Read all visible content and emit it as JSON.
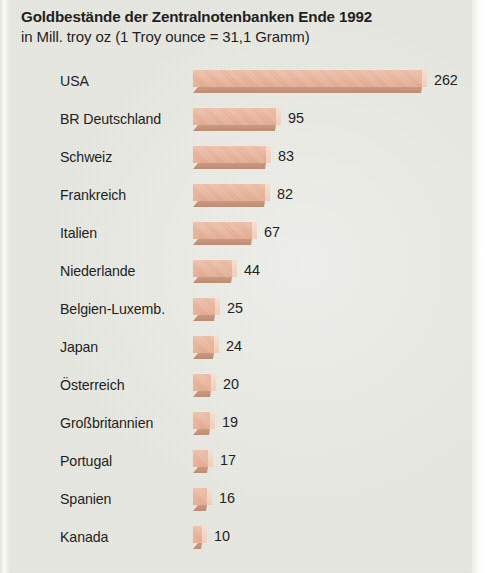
{
  "title": {
    "line1": "Goldbestände der Zentralnotenbanken Ende 1992",
    "line2": "in Mill. troy oz (1 Troy ounce = 31,1 Gramm)"
  },
  "colors": {
    "background": "#e9e9e3",
    "bar_face": "#e7b096",
    "bar_shadow": "#bd8b72",
    "bar_highlight": "#f4d8c7",
    "text": "#231f1c"
  },
  "chart_data": {
    "type": "bar",
    "orientation": "horizontal",
    "title": "Goldbestände der Zentralnotenbanken Ende 1992",
    "subtitle": "in Mill. troy oz (1 Troy ounce = 31,1 Gramm)",
    "xlabel": "",
    "ylabel": "",
    "unit": "Mill. troy oz",
    "grid": false,
    "legend": false,
    "xlim": [
      0,
      262
    ],
    "categories": [
      "USA",
      "BR Deutschland",
      "Schweiz",
      "Frankreich",
      "Italien",
      "Niederlande",
      "Belgien-Luxemb.",
      "Japan",
      "Österreich",
      "Großbritannien",
      "Portugal",
      "Spanien",
      "Kanada"
    ],
    "values": [
      262,
      95,
      83,
      82,
      67,
      44,
      25,
      24,
      20,
      19,
      17,
      16,
      10
    ],
    "rows": [
      {
        "label": "USA",
        "value": 262,
        "value_text": "262"
      },
      {
        "label": "BR Deutschland",
        "value": 95,
        "value_text": "95"
      },
      {
        "label": "Schweiz",
        "value": 83,
        "value_text": "83"
      },
      {
        "label": "Frankreich",
        "value": 82,
        "value_text": "82"
      },
      {
        "label": "Italien",
        "value": 67,
        "value_text": "67"
      },
      {
        "label": "Niederlande",
        "value": 44,
        "value_text": "44"
      },
      {
        "label": "Belgien-Luxemb.",
        "value": 25,
        "value_text": "25"
      },
      {
        "label": "Japan",
        "value": 24,
        "value_text": "24"
      },
      {
        "label": "Österreich",
        "value": 20,
        "value_text": "20"
      },
      {
        "label": "Großbritannien",
        "value": 19,
        "value_text": "19"
      },
      {
        "label": "Portugal",
        "value": 17,
        "value_text": "17"
      },
      {
        "label": "Spanien",
        "value": 16,
        "value_text": "16"
      },
      {
        "label": "Kanada",
        "value": 10,
        "value_text": "10"
      }
    ]
  }
}
